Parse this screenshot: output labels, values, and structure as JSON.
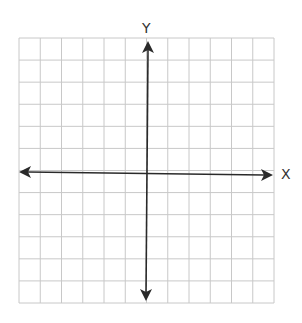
{
  "diagram": {
    "type": "coordinate-plane",
    "x_axis_label": "X",
    "y_axis_label": "Y",
    "grid": {
      "columns": 12,
      "rows": 12,
      "left": 19,
      "top": 38,
      "right": 274,
      "bottom": 303,
      "line_color": "#c8c8c8"
    },
    "axis_color": "#2a2a2a",
    "origin_px": [
      146,
      172
    ]
  }
}
